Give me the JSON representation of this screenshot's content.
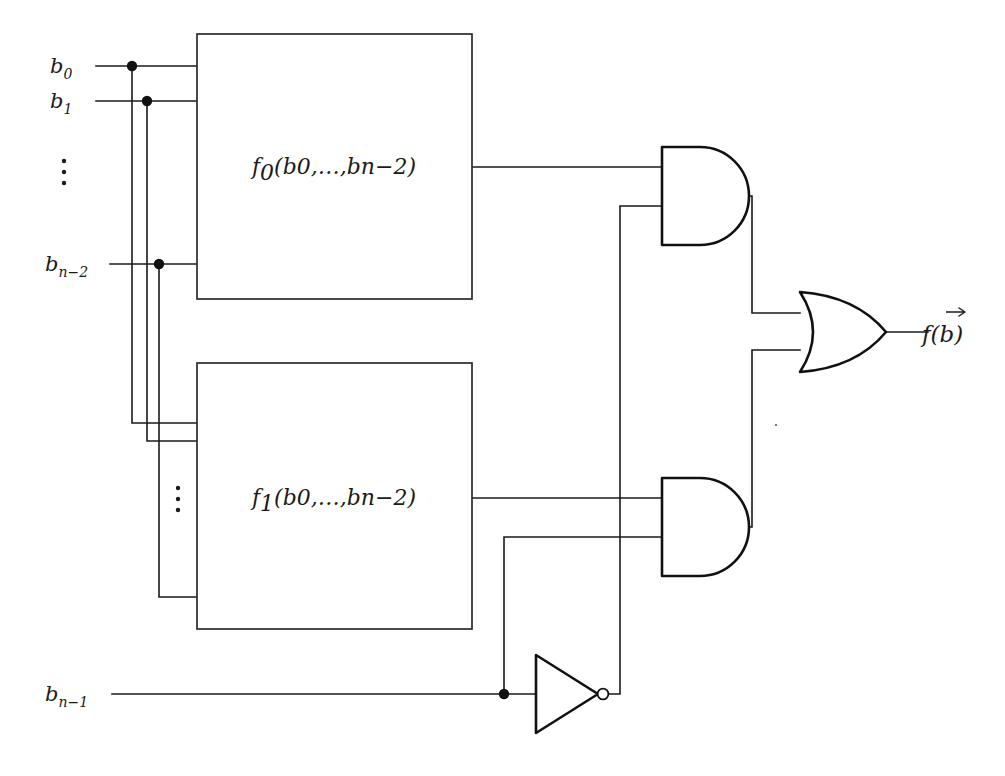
{
  "figure": {
    "kind": "logic-circuit-diagram",
    "ink_color": "#1a1a1a",
    "background_color": "#ffffff"
  },
  "inputs": [
    {
      "id": "b0",
      "base": "b",
      "sub": "0",
      "text": "b0",
      "y": 66
    },
    {
      "id": "b1",
      "base": "b",
      "sub": "1",
      "text": "b1",
      "y": 101
    },
    {
      "id": "bn2",
      "base": "b",
      "sub": "n−2",
      "text": "bn−2",
      "y": 264
    },
    {
      "id": "bn1",
      "base": "b",
      "sub": "n−1",
      "text": "bn−1",
      "y": 694
    }
  ],
  "ellipses": [
    {
      "id": "input-ellipsis-left",
      "x": 64,
      "y": 170
    },
    {
      "id": "input-ellipsis-block2",
      "x": 178,
      "y": 497
    }
  ],
  "blocks": [
    {
      "id": "f0-block",
      "label_base": "f",
      "label_sub": "0",
      "label_args": "(b0,…,bn−2)",
      "label_full": "f0(b0,…,bn−2)",
      "x": 197,
      "y": 34,
      "width": 275,
      "height": 265
    },
    {
      "id": "f1-block",
      "label_base": "f",
      "label_sub": "1",
      "label_args": "(b0,…,bn−2)",
      "label_full": "f1(b0,…,bn−2)",
      "x": 197,
      "y": 363,
      "width": 275,
      "height": 266
    }
  ],
  "gates": [
    {
      "id": "and-gate-top",
      "type": "and",
      "label": "AND",
      "x": 662,
      "y": 147,
      "width": 80,
      "height": 98
    },
    {
      "id": "and-gate-bottom",
      "type": "and",
      "label": "AND",
      "x": 662,
      "y": 478,
      "width": 80,
      "height": 98
    },
    {
      "id": "or-gate",
      "type": "or",
      "label": "OR",
      "x": 800,
      "y": 292,
      "width": 86,
      "height": 80
    },
    {
      "id": "not-gate",
      "type": "not",
      "label": "NOT",
      "x": 536,
      "y": 655,
      "width": 64,
      "height": 78
    }
  ],
  "junctions": [
    {
      "id": "tap-b0",
      "x": 132,
      "y": 66
    },
    {
      "id": "tap-b1",
      "x": 147,
      "y": 101
    },
    {
      "id": "tap-bn2",
      "x": 159,
      "y": 264
    },
    {
      "id": "tap-bn1",
      "x": 504,
      "y": 694
    }
  ],
  "output": {
    "id": "circuit-output",
    "label_base": "f",
    "label_arg": "b",
    "label_full": "f(b⃗)",
    "has_vector_arrow": true,
    "x": 922,
    "y": 332
  }
}
